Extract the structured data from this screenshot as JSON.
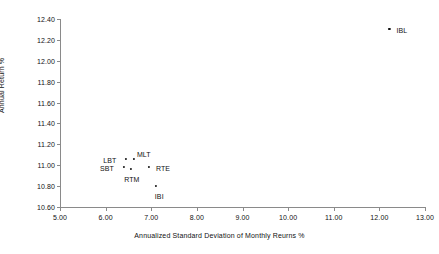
{
  "chart_data": {
    "type": "scatter",
    "title": "",
    "xlabel": "Annualized Standard Deviation of Monthly Reurns %",
    "ylabel": "Annual Return %",
    "xlim": [
      5.0,
      13.0
    ],
    "ylim": [
      10.6,
      12.4
    ],
    "xticks": [
      "5.00",
      "6.00",
      "7.00",
      "8.00",
      "9.00",
      "10.00",
      "11.00",
      "12.00",
      "13.00"
    ],
    "xtick_values": [
      5.0,
      6.0,
      7.0,
      8.0,
      9.0,
      10.0,
      11.0,
      12.0,
      13.0
    ],
    "yticks": [
      "10.60",
      "10.80",
      "11.00",
      "11.20",
      "11.40",
      "11.60",
      "11.80",
      "12.00",
      "12.20",
      "12.40"
    ],
    "ytick_values": [
      10.6,
      10.8,
      11.0,
      11.2,
      11.4,
      11.6,
      11.8,
      12.0,
      12.2,
      12.4
    ],
    "grid": false,
    "legend": "none",
    "marker_color": "#111111",
    "axis_color": "#8a8a8a",
    "points": [
      {
        "label": "IBL",
        "x": 12.22,
        "y": 12.305,
        "label_dx": 7,
        "label_dy": 2
      },
      {
        "label": "LBT",
        "x": 6.45,
        "y": 11.062,
        "label_dx": -23,
        "label_dy": 2
      },
      {
        "label": "MLT",
        "x": 6.62,
        "y": 11.062,
        "label_dx": 3,
        "label_dy": -4
      },
      {
        "label": "SBT",
        "x": 6.4,
        "y": 10.98,
        "label_dx": -24,
        "label_dy": 2
      },
      {
        "label": "RTM",
        "x": 6.56,
        "y": 10.963,
        "label_dx": -7,
        "label_dy": 11
      },
      {
        "label": "RTE",
        "x": 6.95,
        "y": 10.98,
        "label_dx": 7,
        "label_dy": 2
      },
      {
        "label": "IBI",
        "x": 7.1,
        "y": 10.8,
        "label_dx": -1,
        "label_dy": 11
      }
    ]
  }
}
